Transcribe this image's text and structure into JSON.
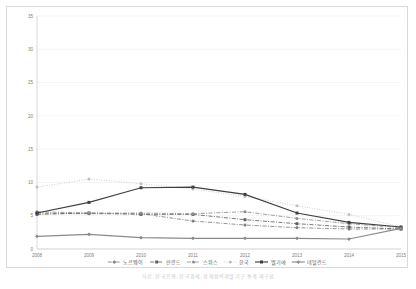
{
  "caption": "자료: 한국은행, 한국경제, 경제협력개발기구 통계 재구성",
  "chart_data": {
    "type": "line",
    "title": "",
    "xlabel": "",
    "ylabel": "",
    "x": [
      "2008",
      "2009",
      "2010",
      "2011",
      "2012",
      "2013",
      "2014",
      "2015"
    ],
    "ylim": [
      0,
      35
    ],
    "yticks": [
      0,
      5,
      10,
      15,
      20,
      25,
      30,
      35
    ],
    "grid": true,
    "legend_position": "bottom",
    "series": [
      {
        "name": "노르웨이",
        "values": [
          5.4,
          5.3,
          5.3,
          4.2,
          3.6,
          3.2,
          3.0,
          3.0
        ],
        "style": "dash-dot",
        "marker": "diamond",
        "color": "#7f7f7f"
      },
      {
        "name": "핀란드",
        "values": [
          5.2,
          5.4,
          5.2,
          5.2,
          4.4,
          3.8,
          3.3,
          3.0
        ],
        "style": "dash-dot",
        "marker": "square",
        "color": "#606060"
      },
      {
        "name": "스위스",
        "values": [
          5.6,
          5.4,
          5.4,
          5.3,
          5.6,
          4.6,
          3.8,
          3.2
        ],
        "style": "dash-dot",
        "marker": "circle",
        "color": "#8c8c8c"
      },
      {
        "name": "한국",
        "values": [
          9.3,
          10.5,
          9.8,
          9.0,
          7.9,
          6.5,
          5.2,
          3.3
        ],
        "style": "dotted",
        "marker": "circle",
        "color": "#bfbfbf"
      },
      {
        "name": "벨기에",
        "values": [
          5.4,
          7.0,
          9.2,
          9.3,
          8.2,
          5.4,
          4.0,
          3.3
        ],
        "style": "solid",
        "marker": "square",
        "color": "#3f3f3f"
      },
      {
        "name": "네덜란드",
        "values": [
          1.9,
          2.2,
          1.7,
          1.6,
          1.6,
          1.6,
          1.5,
          3.1
        ],
        "style": "solid",
        "marker": "diamond",
        "color": "#8a8a8a"
      }
    ]
  }
}
